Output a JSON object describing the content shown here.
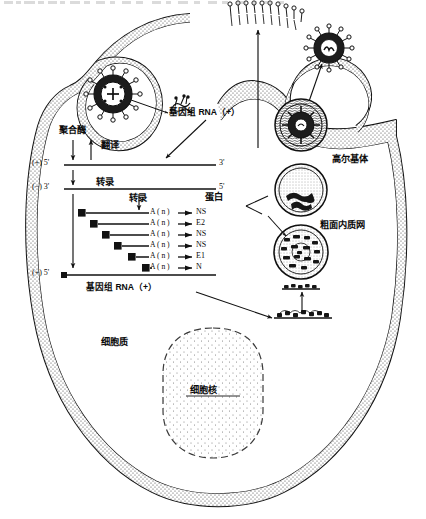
{
  "figure": {
    "title_hidden_top_strip": "",
    "kind": "virus-replication-cycle-diagram",
    "organism_note": "enveloped positive-sense RNA virus replication in host cell"
  },
  "labels": {
    "polymerase": "聚合酶",
    "translation": "翻译",
    "transcription_1": "转录",
    "transcription_2": "转录",
    "genome_rna_top": "基因组 RNA（+）",
    "genome_rna_bottom": "基因组 RNA（+）",
    "protein_header": "蛋白",
    "golgi": "高尔基体",
    "rough_er": "粗面内质网",
    "cytoplasm": "细胞质",
    "nucleus": "细胞核"
  },
  "strands": {
    "plus_strand": {
      "left_end": "(+) 5'",
      "right_end": "3'"
    },
    "minus_strand": {
      "left_end": "(−) 3'",
      "right_end": "5'"
    },
    "genome_strand": {
      "left_end": "(+) 5'",
      "right_end": ""
    }
  },
  "mrnas": [
    {
      "tail": "A ( n )",
      "protein": "NS"
    },
    {
      "tail": "A ( n )",
      "protein": "E2"
    },
    {
      "tail": "A ( n )",
      "protein": "NS"
    },
    {
      "tail": "A ( n )",
      "protein": "NS"
    },
    {
      "tail": "A ( n )",
      "protein": "E1"
    },
    {
      "tail": "A ( n )",
      "protein": "N"
    }
  ],
  "structures": {
    "entry_virion": "virion-in-endocytic-vesicle",
    "budding_virion": "budding-virion-exiting-cell",
    "uncoated_genome": "released-genome-rna",
    "membrane_spikes": "glycoprotein-spikes-in-plasma-membrane",
    "organelles": [
      "nucleocapsid-vesicle-upper",
      "golgi-vesicle-middle",
      "rough-er-vesicle-lower"
    ],
    "ribosome_rows": 2
  },
  "colors": {
    "ink": "#101010",
    "stipple": "#4a4a4a",
    "paper": "#ffffff"
  }
}
